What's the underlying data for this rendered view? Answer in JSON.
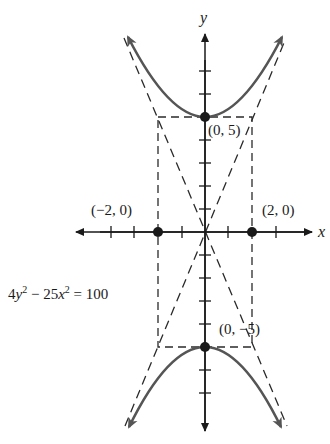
{
  "figure": {
    "equation": {
      "text": "4y² − 25x² = 100",
      "parts": {
        "c1": "4",
        "v1": "y",
        "e1": "2",
        "op": " − ",
        "c2": "25",
        "v2": "x",
        "e2": "2",
        "rhs": " = 100"
      }
    },
    "axes": {
      "x_label": "x",
      "y_label": "y",
      "origin_px": [
        205,
        232
      ],
      "x_unit_px": 23.5,
      "y_unit_px": 23,
      "x_ticks": [
        -4,
        -3,
        -1,
        1,
        3,
        4
      ],
      "y_ticks": [
        -8,
        -7,
        -4,
        -3,
        -2,
        -1,
        1,
        2,
        3,
        4,
        6,
        7
      ]
    },
    "points": [
      {
        "label": "(0, 5)",
        "x": 0,
        "y": 5
      },
      {
        "label": "(0, −5)",
        "x": 0,
        "y": -5
      },
      {
        "label": "(−2, 0)",
        "x": -2,
        "y": 0
      },
      {
        "label": "(2, 0)",
        "x": 2,
        "y": 0
      }
    ],
    "fundamental_rectangle": {
      "x_min": -2,
      "x_max": 2,
      "y_min": -5,
      "y_max": 5,
      "style": "dashed"
    },
    "asymptotes": [
      "y = (5/2)x",
      "y = −(5/2)x"
    ],
    "colors": {
      "curve": "#555555",
      "axes": "#1a1a1a",
      "dashes": "#2a2a2a",
      "points": "#1a1a1a",
      "background": "#ffffff"
    }
  }
}
